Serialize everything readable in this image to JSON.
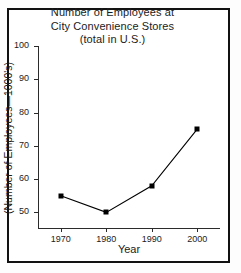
{
  "figure": {
    "title_lines": [
      "Number of Employees at",
      "City Convenience Stores",
      "(total in U.S.)"
    ]
  },
  "chart_data": {
    "type": "line",
    "title": "Number of Employees at City Convenience Stores (total in U.S.)",
    "xlabel": "Year",
    "ylabel": "(Number of Employees—1000's)",
    "x": [
      1970,
      1980,
      1990,
      2000
    ],
    "categories": [
      "1970",
      "1980",
      "1990",
      "2000"
    ],
    "values": [
      55,
      50,
      58,
      75
    ],
    "series": [
      {
        "name": "Number of Employees",
        "values": [
          55,
          50,
          58,
          75
        ]
      }
    ],
    "xtick_labels": [
      "1970",
      "1980",
      "1990",
      "2000"
    ],
    "ytick_labels": [
      "100",
      "90",
      "80",
      "70",
      "60",
      "50"
    ],
    "yticks": [
      100,
      90,
      80,
      70,
      60,
      50
    ],
    "ylim": [
      45,
      100
    ],
    "xlim": [
      1965,
      2005
    ],
    "grid": false,
    "legend": false,
    "marker": "square",
    "marker_color": "#000000",
    "line_color": "#000000"
  }
}
